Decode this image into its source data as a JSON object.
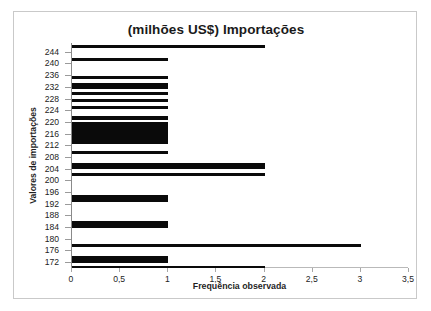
{
  "chart_data": {
    "type": "bar",
    "orientation": "horizontal",
    "title": "(milhões US$) Importações",
    "xlabel": "Frequência observada",
    "ylabel": "Valores de importações",
    "xlim": [
      0,
      3.5
    ],
    "ylim": [
      170,
      247
    ],
    "grid": false,
    "legend": "none",
    "bar_color": "#0a0a0a",
    "xticks": [
      "0",
      "0,5",
      "1",
      "1,5",
      "2",
      "2,5",
      "3",
      "3,5"
    ],
    "xtick_values": [
      0,
      0.5,
      1,
      1.5,
      2,
      2.5,
      3,
      3.5
    ],
    "yticks": [
      "172",
      "176",
      "180",
      "184",
      "188",
      "192",
      "196",
      "200",
      "204",
      "208",
      "212",
      "216",
      "220",
      "224",
      "228",
      "232",
      "236",
      "240",
      "244"
    ],
    "ytick_values": [
      172,
      176,
      180,
      184,
      188,
      192,
      196,
      200,
      204,
      208,
      212,
      216,
      220,
      224,
      228,
      232,
      236,
      240,
      244
    ],
    "categories": [
      172,
      174,
      176,
      178,
      180,
      182,
      184,
      186,
      188,
      190,
      192,
      194,
      196,
      198,
      200,
      202,
      204,
      206,
      208,
      210,
      212,
      214,
      216,
      218,
      220,
      222,
      224,
      226,
      228,
      230,
      232,
      234,
      236,
      238,
      240,
      242,
      244,
      246
    ],
    "values": [
      2,
      0,
      1,
      0,
      0,
      0,
      3,
      0,
      0,
      0,
      1,
      0,
      0,
      0,
      0,
      0,
      1,
      0,
      2,
      0,
      2,
      0,
      1,
      0,
      1,
      1,
      0,
      1,
      1,
      1,
      1,
      1,
      1,
      0,
      1,
      0,
      0,
      2
    ],
    "bars": [
      {
        "category": 246,
        "value": 2
      },
      {
        "category": 244,
        "value": 0
      },
      {
        "category": 242,
        "value": 1
      },
      {
        "category": 240,
        "value": 1
      },
      {
        "category": 238,
        "value": 0
      },
      {
        "category": 236,
        "value": 1
      },
      {
        "category": 234,
        "value": 1
      },
      {
        "category": 232,
        "value": 1
      },
      {
        "category": 230,
        "value": 1
      },
      {
        "category": 228,
        "value": 1
      },
      {
        "category": 226,
        "value": 1
      },
      {
        "category": 224,
        "value": 1
      },
      {
        "category": 222,
        "value": 1
      },
      {
        "category": 220,
        "value": 1
      },
      {
        "category": 218,
        "value": 1
      },
      {
        "category": 216,
        "value": 1
      },
      {
        "category": 214,
        "value": 2
      },
      {
        "category": 212,
        "value": 2
      },
      {
        "category": 210,
        "value": 2
      },
      {
        "category": 208,
        "value": 0
      },
      {
        "category": 206,
        "value": 0
      },
      {
        "category": 204,
        "value": 1
      },
      {
        "category": 202,
        "value": 0
      },
      {
        "category": 200,
        "value": 0
      },
      {
        "category": 198,
        "value": 0
      },
      {
        "category": 196,
        "value": 0
      },
      {
        "category": 194,
        "value": 1
      },
      {
        "category": 192,
        "value": 1
      },
      {
        "category": 190,
        "value": 0
      },
      {
        "category": 188,
        "value": 0
      },
      {
        "category": 186,
        "value": 0
      },
      {
        "category": 184,
        "value": 3
      },
      {
        "category": 182,
        "value": 0
      },
      {
        "category": 180,
        "value": 0
      },
      {
        "category": 178,
        "value": 0
      },
      {
        "category": 176,
        "value": 1
      },
      {
        "category": 174,
        "value": 1
      },
      {
        "category": 172,
        "value": 2
      }
    ],
    "bar_geometry": [
      {
        "name": "bar-246",
        "top": 1.5,
        "height": 3.0,
        "value": 2
      },
      {
        "name": "bar-242",
        "top": 14.5,
        "height": 3.2,
        "value": 1
      },
      {
        "name": "bar-236",
        "top": 33.0,
        "height": 3.4,
        "value": 1
      },
      {
        "name": "bar-234",
        "top": 39.5,
        "height": 6.5,
        "value": 1
      },
      {
        "name": "bar-231",
        "top": 48.5,
        "height": 3.4,
        "value": 1
      },
      {
        "name": "bar-229",
        "top": 55.5,
        "height": 3.4,
        "value": 1
      },
      {
        "name": "bar-227",
        "top": 62.5,
        "height": 3.6,
        "value": 1
      },
      {
        "name": "bar-224",
        "top": 73.0,
        "height": 4.0,
        "value": 1
      },
      {
        "name": "bar-221",
        "top": 79.0,
        "height": 22.0,
        "value": 1
      },
      {
        "name": "bar-217",
        "top": 107.5,
        "height": 3.4,
        "value": 1
      },
      {
        "name": "bar-213",
        "top": 119.5,
        "height": 6.5,
        "value": 2
      },
      {
        "name": "bar-210",
        "top": 130.0,
        "height": 3.0,
        "value": 2
      },
      {
        "name": "bar-204",
        "top": 152.0,
        "height": 6.5,
        "value": 1
      },
      {
        "name": "bar-192",
        "top": 177.5,
        "height": 7.0,
        "value": 1
      },
      {
        "name": "bar-184",
        "top": 201.0,
        "height": 2.8,
        "value": 3
      },
      {
        "name": "bar-176",
        "top": 213.0,
        "height": 7.0,
        "value": 1
      },
      {
        "name": "bar-172",
        "top": 222.5,
        "height": 2.6,
        "value": 2
      }
    ]
  }
}
